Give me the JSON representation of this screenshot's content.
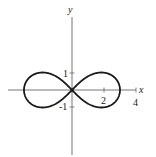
{
  "chart_data": {
    "type": "line",
    "title": "",
    "curve": "lemniscate r^2 = 9 cos(2θ)",
    "xlabel": "x",
    "ylabel": "y",
    "xlim": [
      -4,
      4
    ],
    "ylim": [
      -5,
      5
    ],
    "x_ticks": [
      {
        "value": 2,
        "label": "2"
      },
      {
        "value": 4,
        "label": "4"
      }
    ],
    "y_ticks": [
      {
        "value": 1,
        "label": "1"
      },
      {
        "value": -1,
        "label": "-1"
      }
    ],
    "grid": false,
    "legend": null,
    "series": [
      {
        "name": "lemniscate",
        "x_extent": [
          -3,
          3
        ],
        "y_extent": [
          -1.06,
          1.06
        ],
        "points": [
          [
            0,
            0
          ],
          [
            1.2,
            0.85
          ],
          [
            2,
            1.0
          ],
          [
            2.6,
            0.75
          ],
          [
            3,
            0
          ],
          [
            2.6,
            -0.75
          ],
          [
            2,
            -1.0
          ],
          [
            1.2,
            -0.85
          ],
          [
            0,
            0
          ],
          [
            -1.2,
            0.85
          ],
          [
            -2,
            1.0
          ],
          [
            -2.6,
            0.75
          ],
          [
            -3,
            0
          ],
          [
            -2.6,
            -0.75
          ],
          [
            -2,
            -1.0
          ],
          [
            -1.2,
            -0.85
          ],
          [
            0,
            0
          ]
        ]
      }
    ],
    "colors": {
      "axis": "#555555",
      "curve": "#1a1a1a",
      "text": "#222222"
    }
  },
  "labels": {
    "x_axis": "x",
    "y_axis": "y",
    "tick_x_2": "2",
    "tick_x_4": "4",
    "tick_y_1": "1",
    "tick_y_neg1": "-1"
  }
}
